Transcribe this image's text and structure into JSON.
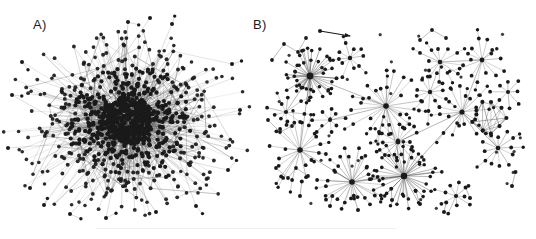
{
  "figure": {
    "width": 536,
    "height": 239,
    "background": "#ffffff",
    "ink_color": "#1a1a1a",
    "edge_color": "#555555"
  },
  "panels": [
    {
      "id": "panel-a",
      "label": "A)",
      "label_x": 33,
      "label_y": 17,
      "description": "dense hairball network",
      "center_x": 128,
      "center_y": 120,
      "radius_x": 108,
      "radius_y": 95,
      "node_count": 900,
      "core_density": "very-high"
    },
    {
      "id": "panel-b",
      "label": "B)",
      "label_x": 253,
      "label_y": 17,
      "description": "sparse modular network with hub-and-spoke star clusters",
      "origin_x": 262,
      "origin_y": 28,
      "width": 274,
      "height": 205,
      "node_count": 430,
      "core_density": "low"
    }
  ],
  "legend_arrow": {
    "name": "directed-edge-marker",
    "x1": 320,
    "y1": 31,
    "x2": 350,
    "y2": 36
  },
  "chart_data": {
    "type": "scatter",
    "title": "",
    "xlabel": "",
    "ylabel": "",
    "panel_a": {
      "layout": "radial-hairball",
      "hub_count": 1,
      "rings": [
        {
          "r_x": 18,
          "r_y": 16,
          "count": 120,
          "dot": 2.3,
          "edge_opacity": 0.95
        },
        {
          "r_x": 34,
          "r_y": 30,
          "count": 150,
          "dot": 2.2,
          "edge_opacity": 0.85
        },
        {
          "r_x": 52,
          "r_y": 45,
          "count": 160,
          "dot": 2.1,
          "edge_opacity": 0.7
        },
        {
          "r_x": 70,
          "r_y": 60,
          "count": 140,
          "dot": 2.0,
          "edge_opacity": 0.55
        },
        {
          "r_x": 88,
          "r_y": 76,
          "count": 100,
          "dot": 1.9,
          "edge_opacity": 0.42
        },
        {
          "r_x": 104,
          "r_y": 90,
          "count": 60,
          "dot": 1.8,
          "edge_opacity": 0.32
        }
      ],
      "outliers": [
        {
          "x": 12,
          "y": 95
        },
        {
          "x": 8,
          "y": 148
        },
        {
          "x": 22,
          "y": 62
        },
        {
          "x": 30,
          "y": 188
        },
        {
          "x": 44,
          "y": 205
        },
        {
          "x": 70,
          "y": 214
        },
        {
          "x": 128,
          "y": 22
        },
        {
          "x": 150,
          "y": 18
        },
        {
          "x": 172,
          "y": 24
        },
        {
          "x": 232,
          "y": 64
        },
        {
          "x": 240,
          "y": 110
        },
        {
          "x": 228,
          "y": 170
        },
        {
          "x": 196,
          "y": 206
        },
        {
          "x": 106,
          "y": 218
        },
        {
          "x": 156,
          "y": 212
        }
      ]
    },
    "panel_b": {
      "layout": "modular-stars",
      "stars": [
        {
          "x": 310,
          "y": 76,
          "spokes": 46,
          "r": 24,
          "hub": 3.4,
          "dense": true
        },
        {
          "x": 386,
          "y": 106,
          "spokes": 26,
          "r": 30,
          "hub": 2.8,
          "dense": false
        },
        {
          "x": 300,
          "y": 150,
          "spokes": 22,
          "r": 26,
          "hub": 2.8,
          "dense": false
        },
        {
          "x": 352,
          "y": 182,
          "spokes": 30,
          "r": 28,
          "hub": 2.8,
          "dense": false
        },
        {
          "x": 404,
          "y": 176,
          "spokes": 40,
          "r": 30,
          "hub": 3.2,
          "dense": true
        },
        {
          "x": 398,
          "y": 142,
          "spokes": 16,
          "r": 18,
          "hub": 2.4,
          "dense": false
        },
        {
          "x": 462,
          "y": 112,
          "spokes": 18,
          "r": 22,
          "hub": 2.6,
          "dense": false
        },
        {
          "x": 482,
          "y": 60,
          "spokes": 14,
          "r": 20,
          "hub": 2.4,
          "dense": false
        },
        {
          "x": 440,
          "y": 62,
          "spokes": 12,
          "r": 18,
          "hub": 2.3,
          "dense": false
        },
        {
          "x": 350,
          "y": 58,
          "spokes": 10,
          "r": 16,
          "hub": 2.2,
          "dense": false
        },
        {
          "x": 430,
          "y": 92,
          "spokes": 11,
          "r": 17,
          "hub": 2.2,
          "dense": false
        },
        {
          "x": 498,
          "y": 148,
          "spokes": 13,
          "r": 19,
          "hub": 2.3,
          "dense": false
        },
        {
          "x": 286,
          "y": 112,
          "spokes": 9,
          "r": 15,
          "hub": 2.1,
          "dense": false
        },
        {
          "x": 330,
          "y": 120,
          "spokes": 8,
          "r": 14,
          "hub": 2.0,
          "dense": false
        },
        {
          "x": 456,
          "y": 196,
          "spokes": 9,
          "r": 15,
          "hub": 2.1,
          "dense": false
        },
        {
          "x": 508,
          "y": 92,
          "spokes": 8,
          "r": 14,
          "hub": 2.0,
          "dense": false
        }
      ],
      "clique": {
        "x": 488,
        "y": 118,
        "nodes": 9,
        "r": 17
      },
      "dyads": [
        {
          "x": 330,
          "y": 206
        },
        {
          "x": 358,
          "y": 210
        },
        {
          "x": 392,
          "y": 200
        },
        {
          "x": 420,
          "y": 204
        },
        {
          "x": 444,
          "y": 212
        },
        {
          "x": 470,
          "y": 198
        },
        {
          "x": 300,
          "y": 196
        },
        {
          "x": 512,
          "y": 186
        }
      ],
      "chains": [
        [
          [
            272,
            60
          ],
          [
            284,
            44
          ],
          [
            298,
            52
          ],
          [
            306,
            38
          ]
        ],
        [
          [
            268,
            120
          ],
          [
            280,
            132
          ],
          [
            292,
            126
          ]
        ],
        [
          [
            276,
            168
          ],
          [
            288,
            178
          ],
          [
            296,
            168
          ],
          [
            308,
            176
          ]
        ],
        [
          [
            420,
            40
          ],
          [
            432,
            30
          ],
          [
            446,
            38
          ]
        ]
      ],
      "bridges": [
        [
          310,
          76,
          386,
          106
        ],
        [
          386,
          106,
          404,
          176
        ],
        [
          300,
          150,
          352,
          182
        ],
        [
          310,
          76,
          300,
          150
        ],
        [
          462,
          112,
          404,
          176
        ],
        [
          482,
          60,
          462,
          112
        ],
        [
          398,
          142,
          462,
          112
        ],
        [
          352,
          182,
          404,
          176
        ],
        [
          440,
          62,
          482,
          60
        ],
        [
          286,
          112,
          310,
          76
        ],
        [
          330,
          120,
          386,
          106
        ],
        [
          498,
          148,
          462,
          112
        ]
      ]
    }
  }
}
